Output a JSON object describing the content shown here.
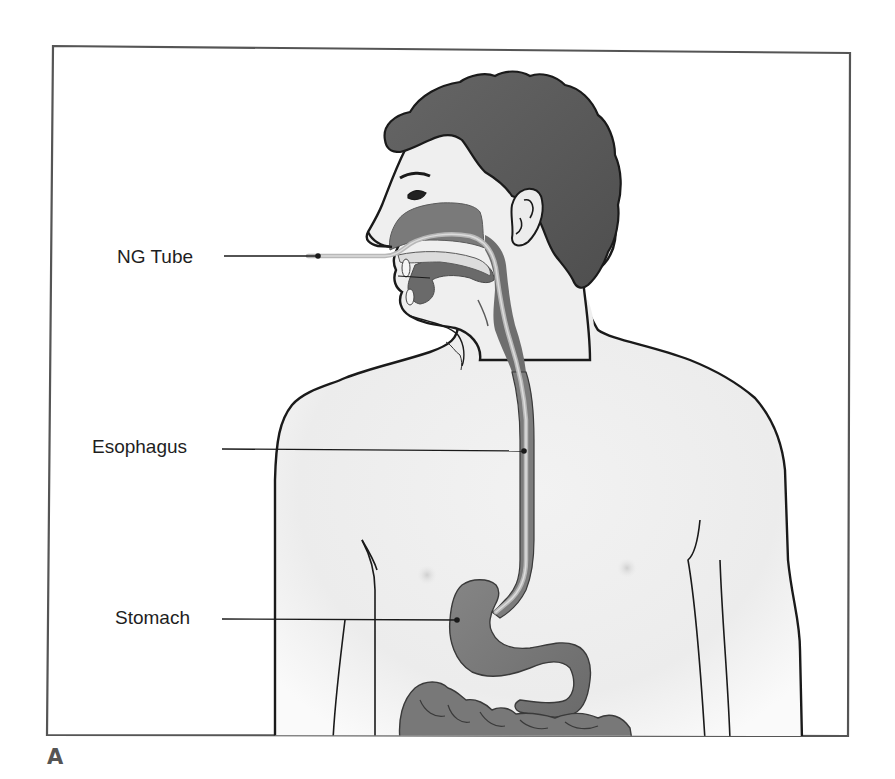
{
  "figure": {
    "panel_letter": "A",
    "labels": [
      {
        "id": "ng-tube",
        "text": "NG Tube",
        "pointer_target": "tube tip at nostril"
      },
      {
        "id": "esophagus",
        "text": "Esophagus",
        "pointer_target": "esophagus"
      },
      {
        "id": "stomach",
        "text": "Stomach",
        "pointer_target": "stomach"
      }
    ],
    "colors": {
      "frame": "#555555",
      "outline": "#1a1a1a",
      "skin": "#efefef",
      "hair": "#5a5a5a",
      "organ": "#7a7a7a",
      "organ_dark": "#606060",
      "tube": "#b5b5b5",
      "label_text": "#1e1e1e"
    }
  }
}
